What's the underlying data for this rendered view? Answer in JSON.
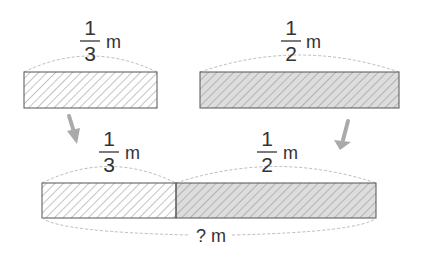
{
  "top_left": {
    "numerator": "1",
    "denominator": "3",
    "unit": "m",
    "fill": "#ffffff"
  },
  "top_right": {
    "numerator": "1",
    "denominator": "2",
    "unit": "m",
    "fill": "#dddddd"
  },
  "bottom": {
    "left_segment": {
      "numerator": "1",
      "denominator": "3",
      "unit": "m",
      "fill": "#ffffff"
    },
    "right_segment": {
      "numerator": "1",
      "denominator": "2",
      "unit": "m",
      "fill": "#dddddd"
    },
    "total_label": "? m"
  },
  "colors": {
    "outline": "#555555",
    "hatch": "#888888",
    "dashed": "#bbbbbb",
    "arrow": "#aaaaaa",
    "text": "#333333"
  }
}
